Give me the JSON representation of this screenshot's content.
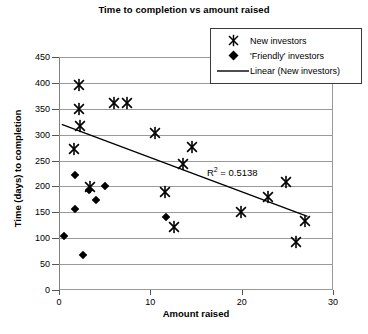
{
  "chart_data": {
    "type": "scatter",
    "title": "Time to completion vs amount raised",
    "xlabel": "Amount raised",
    "ylabel": "Time (days) to completion",
    "xlim": [
      0,
      30
    ],
    "ylim": [
      0,
      450
    ],
    "xticks": [
      0,
      10,
      20,
      30
    ],
    "yticks": [
      0,
      50,
      100,
      150,
      200,
      250,
      300,
      350,
      400,
      450
    ],
    "grid": "horizontal",
    "legend_position": "top-right",
    "annotations": [
      {
        "name": "r-squared",
        "text": "R² = 0.5138",
        "value": 0.5138,
        "x": 16.2,
        "y": 228
      }
    ],
    "series": [
      {
        "name": "New investors",
        "marker": "x-star",
        "points": [
          {
            "x": 2.2,
            "y": 397
          },
          {
            "x": 2.2,
            "y": 352
          },
          {
            "x": 6.0,
            "y": 363
          },
          {
            "x": 7.4,
            "y": 363
          },
          {
            "x": 2.3,
            "y": 318
          },
          {
            "x": 10.5,
            "y": 305
          },
          {
            "x": 1.6,
            "y": 275
          },
          {
            "x": 14.6,
            "y": 278
          },
          {
            "x": 13.6,
            "y": 246
          },
          {
            "x": 24.9,
            "y": 211
          },
          {
            "x": 3.4,
            "y": 201
          },
          {
            "x": 11.6,
            "y": 192
          },
          {
            "x": 22.9,
            "y": 181
          },
          {
            "x": 19.9,
            "y": 152
          },
          {
            "x": 26.9,
            "y": 136
          },
          {
            "x": 12.6,
            "y": 124
          },
          {
            "x": 25.9,
            "y": 95
          }
        ]
      },
      {
        "name": "'Friendly' investors",
        "marker": "diamond",
        "points": [
          {
            "x": 1.8,
            "y": 231
          },
          {
            "x": 3.3,
            "y": 203
          },
          {
            "x": 5.0,
            "y": 210
          },
          {
            "x": 4.1,
            "y": 183
          },
          {
            "x": 1.8,
            "y": 166
          },
          {
            "x": 11.7,
            "y": 151
          },
          {
            "x": 0.5,
            "y": 113
          },
          {
            "x": 2.6,
            "y": 78
          }
        ]
      }
    ],
    "trendline": {
      "name": "Linear (New investors)",
      "x_start": 0.3,
      "y_start": 320,
      "x_end": 27.2,
      "y_end": 142
    }
  },
  "legend": {
    "items": [
      {
        "key": "x-star-marker-icon",
        "label": "New investors"
      },
      {
        "key": "diamond-marker-icon",
        "label": "'Friendly' investors"
      },
      {
        "key": "line-swatch-icon",
        "label": "Linear (New investors)"
      }
    ]
  }
}
